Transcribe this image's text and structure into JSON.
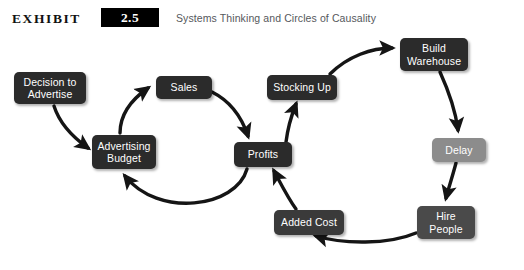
{
  "header": {
    "exhibit_word": "EXHIBIT",
    "exhibit_number": "2.5",
    "subtitle": "Systems Thinking and Circles of Causality"
  },
  "diagram": {
    "type": "causal-loop-diagram",
    "nodes": [
      {
        "id": "decision-to-advertise",
        "label": "Decision to\nAdvertise",
        "line1": "Decision to",
        "line2": "Advertise",
        "color": "#2b2b2b",
        "shade": "dark",
        "x": 14,
        "y": 42,
        "w": 72,
        "h": 32
      },
      {
        "id": "advertising-budget",
        "label": "Advertising\nBudget",
        "line1": "Advertising",
        "line2": "Budget",
        "color": "#2b2b2b",
        "shade": "dark",
        "x": 92,
        "y": 105,
        "w": 64,
        "h": 34
      },
      {
        "id": "sales",
        "label": "Sales",
        "line1": "Sales",
        "line2": "",
        "color": "#2b2b2b",
        "shade": "dark",
        "x": 156,
        "y": 46,
        "w": 56,
        "h": 23
      },
      {
        "id": "profits",
        "label": "Profits",
        "line1": "Profits",
        "line2": "",
        "color": "#2b2b2b",
        "shade": "dark",
        "x": 234,
        "y": 112,
        "w": 58,
        "h": 25
      },
      {
        "id": "stocking-up",
        "label": "Stocking Up",
        "line1": "Stocking Up",
        "line2": "",
        "color": "#2b2b2b",
        "shade": "dark",
        "x": 267,
        "y": 45,
        "w": 70,
        "h": 25
      },
      {
        "id": "build-warehouse",
        "label": "Build\nWarehouse",
        "line1": "Build",
        "line2": "Warehouse",
        "color": "#2b2b2b",
        "shade": "dark",
        "x": 400,
        "y": 8,
        "w": 68,
        "h": 33
      },
      {
        "id": "delay",
        "label": "Delay",
        "line1": "Delay",
        "line2": "",
        "color": "#8c8c8c",
        "shade": "gray",
        "x": 432,
        "y": 108,
        "w": 54,
        "h": 24
      },
      {
        "id": "hire-people",
        "label": "Hire\nPeople",
        "line1": "Hire",
        "line2": "People",
        "color": "#4a4a4a",
        "shade": "dark",
        "x": 417,
        "y": 176,
        "w": 58,
        "h": 33
      },
      {
        "id": "added-cost",
        "label": "Added Cost",
        "line1": "Added Cost",
        "line2": "",
        "color": "#3a3a3a",
        "shade": "dark",
        "x": 274,
        "y": 180,
        "w": 70,
        "h": 25
      }
    ],
    "edges": [
      {
        "from": "decision-to-advertise",
        "to": "advertising-budget"
      },
      {
        "from": "advertising-budget",
        "to": "sales"
      },
      {
        "from": "sales",
        "to": "profits"
      },
      {
        "from": "profits",
        "to": "advertising-budget"
      },
      {
        "from": "profits",
        "to": "stocking-up"
      },
      {
        "from": "stocking-up",
        "to": "build-warehouse"
      },
      {
        "from": "build-warehouse",
        "to": "delay"
      },
      {
        "from": "delay",
        "to": "hire-people"
      },
      {
        "from": "hire-people",
        "to": "added-cost"
      },
      {
        "from": "added-cost",
        "to": "profits"
      }
    ],
    "arrow_color": "#151515"
  }
}
